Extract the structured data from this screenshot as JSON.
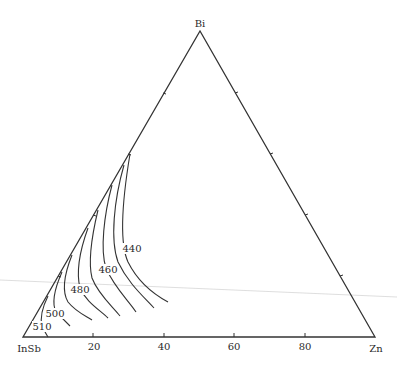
{
  "diagram": {
    "type": "ternary-liquidus-projection",
    "vertices": {
      "top": "Bi",
      "left": "InSb",
      "right": "Zn"
    },
    "bottom_axis_ticks": [
      "20",
      "40",
      "60",
      "80"
    ],
    "isotherm_labels": {
      "t440": "440",
      "t460": "460",
      "t480": "480",
      "t500": "500",
      "t510": "510"
    },
    "colors": {
      "line": "#333333",
      "background": "#ffffff",
      "artifact": "#d0d0d0"
    }
  }
}
